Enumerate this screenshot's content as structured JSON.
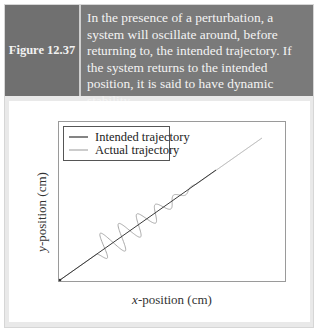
{
  "header": {
    "figure_label": "Figure 12.37",
    "caption": "In the presence of a perturbation, a system will oscillate around, before returning to, the intended trajectory. If the system returns to the intended position, it is said to have dynamic stability."
  },
  "colors": {
    "header_bg": "#7a7a7a",
    "label_bg": "#707070",
    "intended_line": "#333333",
    "actual_line": "#aaaaaa"
  },
  "chart_data": {
    "type": "line",
    "title": "",
    "xlabel_italic": "x",
    "xlabel_rest": "-position (cm)",
    "ylabel_italic": "y",
    "ylabel_rest": "-position (cm)",
    "grid": false,
    "ticks": false,
    "legend_position": "upper left",
    "series": [
      {
        "name": "Intended trajectory",
        "description": "straight diagonal line through the origin",
        "x": [
          0,
          1
        ],
        "y": [
          0,
          1
        ]
      },
      {
        "name": "Actual trajectory",
        "description": "follows the diagonal, oscillates around it with ~6 decaying cycles in the middle section, then returns to the intended line",
        "oscillation_start_x_frac": 0.18,
        "oscillation_end_x_frac": 0.68,
        "cycles": 6,
        "amplitude": "decaying"
      }
    ]
  },
  "legend": {
    "items": [
      {
        "label": "Intended trajectory"
      },
      {
        "label": "Actual trajectory"
      }
    ]
  }
}
